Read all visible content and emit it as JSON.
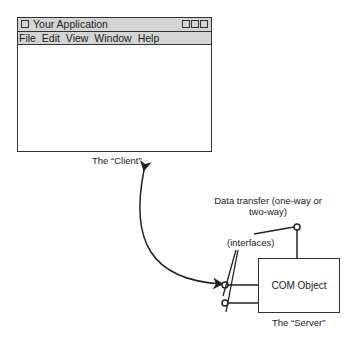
{
  "window": {
    "title": "Your Application",
    "menu": [
      "File",
      "Edit",
      "View",
      "Window",
      "Help"
    ],
    "controls": [
      "minimize",
      "maximize",
      "close"
    ]
  },
  "labels": {
    "client": "The “Client”",
    "data_transfer_line1": "Data transfer (one-way or",
    "data_transfer_line2": "two-way)",
    "interfaces": "(interfaces)",
    "com_object": "COM Object",
    "server": "The “Server”"
  }
}
